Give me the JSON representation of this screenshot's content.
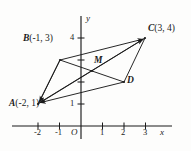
{
  "figure": {
    "kind": "coordinate-geometry-diagram",
    "background_color": "#fdfdfc",
    "stroke_color": "#1b1b1b"
  },
  "axes": {
    "x_axis_label": "x",
    "y_axis_label": "y",
    "origin_label": "O",
    "x_ticks": [
      "-2",
      "-1",
      "1",
      "2",
      "3"
    ],
    "y_ticks": [
      "1",
      "4"
    ],
    "x_range": [
      -2.8,
      4.2
    ],
    "y_range": [
      -0.6,
      4.8
    ]
  },
  "points": [
    {
      "name": "A",
      "label": "A",
      "coords_text": "(-2, 1)",
      "x": -2,
      "y": 1,
      "label_pos": "below-left"
    },
    {
      "name": "B",
      "label": "B",
      "coords_text": "(-1, 3)",
      "x": -1,
      "y": 3,
      "label_pos": "left"
    },
    {
      "name": "C",
      "label": "C",
      "coords_text": "(3, 4)",
      "x": 3,
      "y": 4,
      "label_pos": "right"
    },
    {
      "name": "D",
      "label": "D",
      "coords_text": "",
      "x": 2,
      "y": 2,
      "label_pos": "right"
    },
    {
      "name": "M",
      "label": "M",
      "coords_text": "",
      "x": 0.5,
      "y": 2.5,
      "label_pos": "above-right"
    }
  ],
  "segments": [
    {
      "from": "A",
      "to": "B",
      "arrow": "none"
    },
    {
      "from": "B",
      "to": "C",
      "arrow": "to-C"
    },
    {
      "from": "C",
      "to": "D",
      "arrow": "none"
    },
    {
      "from": "A",
      "to": "D",
      "arrow": "none"
    },
    {
      "from": "A",
      "to": "C",
      "arrow": "to-C"
    },
    {
      "from": "B",
      "to": "D",
      "arrow": "none"
    },
    {
      "from": "B",
      "to": "A",
      "arrow": "to-A"
    },
    {
      "from": "C",
      "to": "A",
      "arrow": "to-A"
    },
    {
      "from": "D",
      "to": "A",
      "arrow": "to-A"
    }
  ]
}
